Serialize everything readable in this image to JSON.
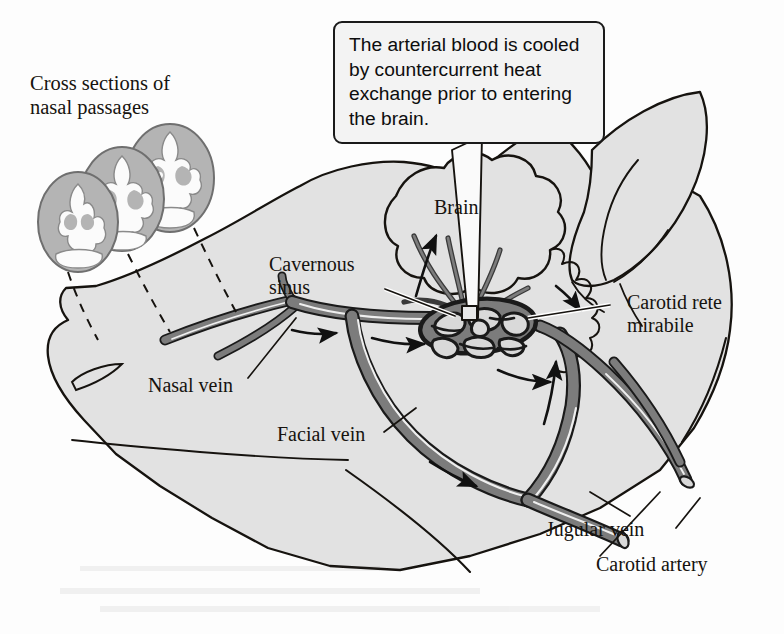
{
  "figure": {
    "kind": "anatomical-diagram",
    "background_color": "#fdfdfd"
  },
  "callout": {
    "text": "The arterial blood is cooled by countercurrent heat exchange prior to entering the brain."
  },
  "labels": {
    "cross_sections": "Cross sections of\nnasal passages",
    "brain": "Brain",
    "cavernous_sinus": "Cavernous\nsinus",
    "carotid_rete": "Carotid rete\nmirabile",
    "nasal_vein": "Nasal vein",
    "facial_vein": "Facial vein",
    "jugular_vein": "Jugular vein",
    "carotid_artery": "Carotid artery"
  },
  "colors": {
    "outline": "#16130f",
    "head_fill": "#e2e2e2",
    "vessel_fill": "#7c7c7c",
    "vessel_outline": "#1a1a1a",
    "vessel_highlight": "#f2f2f2",
    "cross_section_fill": "#b4b4b4",
    "cross_section_detail": "#fbfbfb",
    "callout_fill": "#f3f3f3",
    "text": "#16130f"
  }
}
